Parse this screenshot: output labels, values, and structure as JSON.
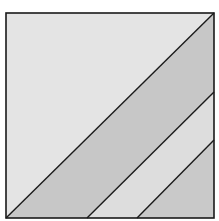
{
  "figure": {
    "square": {
      "x": 6,
      "y": 13,
      "width": 208,
      "height": 205
    },
    "regions": [
      {
        "name": "top-left-triangle",
        "fill": "#e4e4e4"
      },
      {
        "name": "band-1",
        "fill": "#c7c7c7"
      },
      {
        "name": "band-2",
        "fill": "#dddddd"
      },
      {
        "name": "bottom-right-triangle",
        "fill": "#c9c9c9"
      }
    ],
    "line_color": "#1a1a1a"
  }
}
